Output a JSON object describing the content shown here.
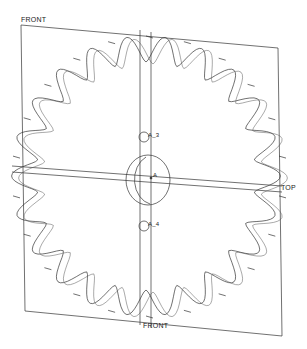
{
  "viewport": {
    "background": "#ffffff",
    "line_color": "#333333"
  },
  "model": {
    "type": "sprocket",
    "teeth": 22
  },
  "datum_planes": {
    "front_top_label": "FRONT",
    "front_bottom_label": "FRONT",
    "top_label": "TOP"
  },
  "datum_axes": {
    "upper_label": "A_3",
    "center_label": "A",
    "lower_label": "A_4"
  }
}
